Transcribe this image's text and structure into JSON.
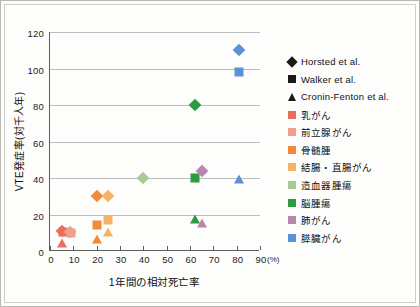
{
  "chart_data": {
    "type": "scatter",
    "title": "",
    "xlabel": "1年間の相対死亡率",
    "xunit": "(%)",
    "ylabel": "VTE発症率(対千人年)",
    "xlim": [
      0,
      90
    ],
    "ylim": [
      0,
      120
    ],
    "xticks": [
      0,
      10,
      20,
      30,
      40,
      50,
      60,
      70,
      80,
      90
    ],
    "yticks": [
      0,
      20,
      40,
      60,
      80,
      100,
      120
    ],
    "grid": "horizontal",
    "legend_position": "right",
    "series": [
      {
        "name": "Horsted et al.",
        "marker": "diamond",
        "color": "#1a1a1a",
        "note": "study shape only"
      },
      {
        "name": "Walker et al.",
        "marker": "square",
        "color": "#1a1a1a",
        "note": "study shape only"
      },
      {
        "name": "Cronin-Fenton et al.",
        "marker": "triangle",
        "color": "#1a1a1a",
        "note": "study shape only"
      }
    ],
    "cancer_colors": [
      {
        "name": "乳がん",
        "color": "#e8705b"
      },
      {
        "name": "前立腺がん",
        "color": "#f0a08a"
      },
      {
        "name": "骨髄腫",
        "color": "#f08b3c"
      },
      {
        "name": "結腸・直腸がん",
        "color": "#f4b267"
      },
      {
        "name": "造血器腫瘍",
        "color": "#a8cb96"
      },
      {
        "name": "脳腫瘍",
        "color": "#2e9b3f"
      },
      {
        "name": "肺がん",
        "color": "#b887ae"
      },
      {
        "name": "膵臓がん",
        "color": "#5b92d6"
      }
    ],
    "points": [
      {
        "cancer": "乳がん",
        "study": "Horsted et al.",
        "marker": "diamond",
        "color": "#e8705b",
        "x": 5,
        "y": 11
      },
      {
        "cancer": "乳がん",
        "study": "Walker et al.",
        "marker": "square",
        "color": "#e8705b",
        "x": 5.5,
        "y": 10.5
      },
      {
        "cancer": "乳がん",
        "study": "Cronin-Fenton et al.",
        "marker": "triangle",
        "color": "#e8705b",
        "x": 5,
        "y": 5
      },
      {
        "cancer": "前立腺がん",
        "study": "Walker et al.",
        "marker": "square",
        "color": "#f0a08a",
        "x": 9,
        "y": 10
      },
      {
        "cancer": "前立腺がん",
        "study": "Horsted et al.",
        "marker": "diamond",
        "color": "#f0a08a",
        "x": 8.5,
        "y": 10.5
      },
      {
        "cancer": "骨髄腫",
        "study": "Horsted et al.",
        "marker": "diamond",
        "color": "#f08b3c",
        "x": 20,
        "y": 30
      },
      {
        "cancer": "骨髄腫",
        "study": "Walker et al.",
        "marker": "square",
        "color": "#f08b3c",
        "x": 20,
        "y": 14
      },
      {
        "cancer": "骨髄腫",
        "study": "Cronin-Fenton et al.",
        "marker": "triangle",
        "color": "#f08b3c",
        "x": 20,
        "y": 7
      },
      {
        "cancer": "結腸・直腸がん",
        "study": "Horsted et al.",
        "marker": "diamond",
        "color": "#f4b267",
        "x": 25,
        "y": 30
      },
      {
        "cancer": "結腸・直腸がん",
        "study": "Walker et al.",
        "marker": "square",
        "color": "#f4b267",
        "x": 25,
        "y": 17
      },
      {
        "cancer": "結腸・直腸がん",
        "study": "Cronin-Fenton et al.",
        "marker": "triangle",
        "color": "#f4b267",
        "x": 25,
        "y": 11
      },
      {
        "cancer": "造血器腫瘍",
        "study": "Horsted et al.",
        "marker": "diamond",
        "color": "#a8cb96",
        "x": 40,
        "y": 40
      },
      {
        "cancer": "脳腫瘍",
        "study": "Horsted et al.",
        "marker": "diamond",
        "color": "#2e9b3f",
        "x": 62,
        "y": 80
      },
      {
        "cancer": "脳腫瘍",
        "study": "Walker et al.",
        "marker": "square",
        "color": "#2e9b3f",
        "x": 62,
        "y": 40
      },
      {
        "cancer": "脳腫瘍",
        "study": "Cronin-Fenton et al.",
        "marker": "triangle",
        "color": "#2e9b3f",
        "x": 62,
        "y": 18
      },
      {
        "cancer": "肺がん",
        "study": "Horsted et al.",
        "marker": "diamond",
        "color": "#b887ae",
        "x": 65,
        "y": 44
      },
      {
        "cancer": "肺がん",
        "study": "Cronin-Fenton et al.",
        "marker": "triangle",
        "color": "#b887ae",
        "x": 65,
        "y": 16
      },
      {
        "cancer": "膵臓がん",
        "study": "Horsted et al.",
        "marker": "diamond",
        "color": "#5b92d6",
        "x": 81,
        "y": 110
      },
      {
        "cancer": "膵臓がん",
        "study": "Walker et al.",
        "marker": "square",
        "color": "#5b92d6",
        "x": 81,
        "y": 98
      },
      {
        "cancer": "膵臓がん",
        "study": "Cronin-Fenton et al.",
        "marker": "triangle",
        "color": "#5b92d6",
        "x": 81,
        "y": 40
      }
    ]
  },
  "legend": {
    "items": [
      {
        "label": "Horsted et al.",
        "marker": "diamond",
        "color": "#1a1a1a"
      },
      {
        "label": "Walker et al.",
        "marker": "square",
        "color": "#1a1a1a"
      },
      {
        "label": "Cronin-Fenton et al.",
        "marker": "triangle",
        "color": "#1a1a1a"
      },
      {
        "label": "乳がん",
        "marker": "square",
        "color": "#e8705b"
      },
      {
        "label": "前立腺がん",
        "marker": "square",
        "color": "#f0a08a"
      },
      {
        "label": "骨髄腫",
        "marker": "square",
        "color": "#f08b3c"
      },
      {
        "label": "結腸・直腸がん",
        "marker": "square",
        "color": "#f4b267"
      },
      {
        "label": "造血器腫瘍",
        "marker": "square",
        "color": "#a8cb96"
      },
      {
        "label": "脳腫瘍",
        "marker": "square",
        "color": "#2e9b3f"
      },
      {
        "label": "肺がん",
        "marker": "square",
        "color": "#b887ae"
      },
      {
        "label": "膵臓がん",
        "marker": "square",
        "color": "#5b92d6"
      }
    ]
  }
}
